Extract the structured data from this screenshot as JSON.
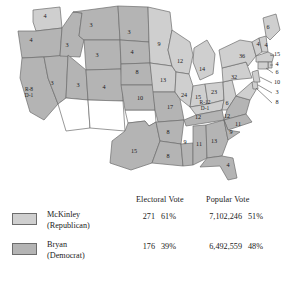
{
  "map": {
    "fill_republican": "#cfcfcf",
    "fill_democrat": "#b4b4b4",
    "fill_territory": "#ffffff",
    "border_color": "#6d6d6d",
    "states": [
      {
        "id": "washington",
        "label": "4",
        "x": 45,
        "y": 17
      },
      {
        "id": "oregon",
        "label": "4",
        "x": 31,
        "y": 41
      },
      {
        "id": "california",
        "label": "R-8",
        "x": 29,
        "y": 93,
        "label2": "D-1"
      },
      {
        "id": "nevada",
        "label": "3",
        "x": 52,
        "y": 84
      },
      {
        "id": "idaho",
        "label": "3",
        "x": 67,
        "y": 46
      },
      {
        "id": "montana",
        "label": "3",
        "x": 91,
        "y": 26
      },
      {
        "id": "wyoming",
        "label": "3",
        "x": 97,
        "y": 56
      },
      {
        "id": "utah",
        "label": "3",
        "x": 78,
        "y": 86
      },
      {
        "id": "colorado",
        "label": "4",
        "x": 104,
        "y": 88
      },
      {
        "id": "north-dakota",
        "label": "3",
        "x": 129,
        "y": 33
      },
      {
        "id": "south-dakota",
        "label": "4",
        "x": 132,
        "y": 53
      },
      {
        "id": "nebraska",
        "label": "8",
        "x": 137,
        "y": 73
      },
      {
        "id": "kansas",
        "label": "10",
        "x": 140,
        "y": 99
      },
      {
        "id": "texas",
        "label": "15",
        "x": 134,
        "y": 152
      },
      {
        "id": "minnesota",
        "label": "9",
        "x": 159,
        "y": 45
      },
      {
        "id": "iowa",
        "label": "13",
        "x": 163,
        "y": 81
      },
      {
        "id": "missouri",
        "label": "17",
        "x": 170,
        "y": 108
      },
      {
        "id": "arkansas",
        "label": "8",
        "x": 168,
        "y": 133
      },
      {
        "id": "louisiana",
        "label": "8",
        "x": 168,
        "y": 157
      },
      {
        "id": "wisconsin",
        "label": "12",
        "x": 180,
        "y": 62
      },
      {
        "id": "illinois",
        "label": "24",
        "x": 184,
        "y": 96
      },
      {
        "id": "mississippi",
        "label": "9",
        "x": 185,
        "y": 143
      },
      {
        "id": "michigan",
        "label": "14",
        "x": 202,
        "y": 70
      },
      {
        "id": "indiana",
        "label": "15",
        "x": 198,
        "y": 98
      },
      {
        "id": "tennessee",
        "label": "12",
        "x": 198,
        "y": 118
      },
      {
        "id": "alabama",
        "label": "11",
        "x": 199,
        "y": 145
      },
      {
        "id": "ohio",
        "label": "23",
        "x": 214,
        "y": 93
      },
      {
        "id": "kentucky",
        "label": "R-12",
        "x": 205,
        "y": 106,
        "label2": "D-1"
      },
      {
        "id": "georgia",
        "label": "13",
        "x": 214,
        "y": 142
      },
      {
        "id": "florida",
        "label": "4",
        "x": 228,
        "y": 166
      },
      {
        "id": "west-virginia",
        "label": "6",
        "x": 227,
        "y": 104
      },
      {
        "id": "virginia",
        "label": "12",
        "x": 227,
        "y": 117
      },
      {
        "id": "north-carolina",
        "label": "11",
        "x": 238,
        "y": 125
      },
      {
        "id": "south-carolina",
        "label": "9",
        "x": 231,
        "y": 133
      },
      {
        "id": "pennsylvania",
        "label": "32",
        "x": 234,
        "y": 78
      },
      {
        "id": "new-york",
        "label": "36",
        "x": 242,
        "y": 57
      },
      {
        "id": "maine",
        "label": "6",
        "x": 268,
        "y": 28
      },
      {
        "id": "vermont",
        "label": "4",
        "x": 258,
        "y": 45
      },
      {
        "id": "new-hampshire",
        "label": "4",
        "x": 266,
        "y": 46
      },
      {
        "id": "massachusetts",
        "label": "15",
        "x": 277,
        "y": 55
      },
      {
        "id": "rhode-island",
        "label": "4",
        "x": 277,
        "y": 65
      },
      {
        "id": "connecticut",
        "label": "6",
        "x": 277,
        "y": 73
      },
      {
        "id": "new-jersey",
        "label": "10",
        "x": 277,
        "y": 83
      },
      {
        "id": "delaware",
        "label": "3",
        "x": 277,
        "y": 93
      },
      {
        "id": "maryland",
        "label": "8",
        "x": 277,
        "y": 103
      }
    ]
  },
  "legend": {
    "headers": {
      "electoral": "Electoral Vote",
      "popular": "Popular Vote"
    },
    "rows": [
      {
        "id": "mckinley",
        "name": "McKinley",
        "party": "(Republican)",
        "electoral_votes": "271",
        "electoral_pct": "61%",
        "popular_votes": "7,102,246",
        "popular_pct": "51%",
        "swatch": "#cfcfcf"
      },
      {
        "id": "bryan",
        "name": "Bryan",
        "party": "(Democrat)",
        "electoral_votes": "176",
        "electoral_pct": "39%",
        "popular_votes": "6,492,559",
        "popular_pct": "48%",
        "swatch": "#b4b4b4"
      }
    ]
  }
}
